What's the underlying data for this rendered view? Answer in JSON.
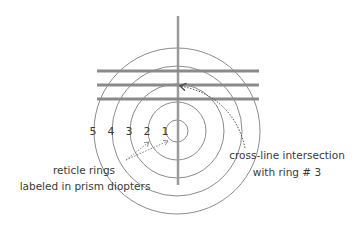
{
  "diagram": {
    "center": {
      "x": 177,
      "y": 131
    },
    "rings": [
      {
        "number": "1",
        "radius": 11
      },
      {
        "number": "2",
        "radius": 29
      },
      {
        "number": "3",
        "radius": 47
      },
      {
        "number": "4",
        "radius": 65
      },
      {
        "number": "5",
        "radius": 83
      }
    ],
    "ring_labels": [
      "5",
      "4",
      "3",
      "2",
      "1"
    ],
    "horizontal_lines_y": [
      71,
      85,
      99
    ],
    "colors": {
      "ring_stroke": "#8c8c8c",
      "cross_line": "#8a8a8a",
      "text": "#3a3a3a",
      "arrow": "#555555"
    },
    "annotations": {
      "left_line1": "reticle rings",
      "left_line2": "labeled in prism diopters",
      "right_line1": "cross-line intersection",
      "right_line2": "with ring # 3"
    }
  }
}
